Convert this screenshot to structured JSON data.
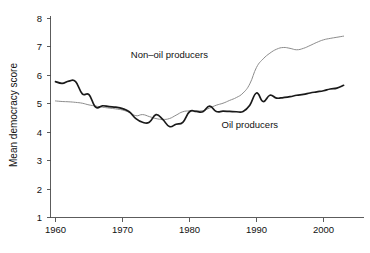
{
  "chart_data": {
    "type": "line",
    "title": "",
    "xlabel": "",
    "ylabel": "Mean democracy score",
    "xlim": [
      1960,
      2003
    ],
    "ylim": [
      1,
      8
    ],
    "grid": false,
    "legend_position": "inline-annotations",
    "xticks": [
      "1960",
      "1970",
      "1980",
      "1990",
      "2000"
    ],
    "xtick_values": [
      1960,
      1970,
      1980,
      1990,
      2000
    ],
    "yticks": [
      "1",
      "2",
      "3",
      "4",
      "5",
      "6",
      "7",
      "8"
    ],
    "ytick_values": [
      1,
      2,
      3,
      4,
      5,
      6,
      7,
      8
    ],
    "x": [
      1960,
      1961,
      1962,
      1963,
      1964,
      1965,
      1966,
      1967,
      1968,
      1969,
      1970,
      1971,
      1972,
      1973,
      1974,
      1975,
      1976,
      1977,
      1978,
      1979,
      1980,
      1981,
      1982,
      1983,
      1984,
      1985,
      1986,
      1987,
      1988,
      1989,
      1990,
      1991,
      1992,
      1993,
      1994,
      1995,
      1996,
      1997,
      1998,
      1999,
      2000,
      2001,
      2002,
      2003
    ],
    "series": [
      {
        "name": "Oil producers",
        "color": "#1a1a1a",
        "label_x": 1989,
        "label_y": 4.15,
        "values": [
          5.78,
          5.72,
          5.8,
          5.78,
          5.35,
          5.32,
          4.88,
          4.93,
          4.9,
          4.88,
          4.83,
          4.72,
          4.48,
          4.35,
          4.35,
          4.62,
          4.45,
          4.2,
          4.28,
          4.35,
          4.72,
          4.73,
          4.72,
          4.92,
          4.73,
          4.74,
          4.73,
          4.72,
          4.73,
          4.95,
          5.38,
          5.08,
          5.3,
          5.2,
          5.22,
          5.25,
          5.3,
          5.33,
          5.38,
          5.42,
          5.46,
          5.52,
          5.55,
          5.65
        ]
      },
      {
        "name": "Non–oil producers",
        "color": "#8c8c8c",
        "label_x": 1977,
        "label_y": 6.6,
        "values": [
          5.1,
          5.08,
          5.07,
          5.05,
          5.02,
          4.96,
          4.92,
          4.88,
          4.85,
          4.82,
          4.78,
          4.7,
          4.58,
          4.62,
          4.55,
          4.48,
          4.45,
          4.48,
          4.6,
          4.72,
          4.75,
          4.75,
          4.76,
          4.85,
          4.95,
          5.02,
          5.12,
          5.22,
          5.38,
          5.7,
          6.28,
          6.58,
          6.78,
          6.92,
          6.98,
          6.95,
          6.9,
          6.95,
          7.05,
          7.16,
          7.25,
          7.3,
          7.34,
          7.38
        ]
      }
    ]
  },
  "figure": {
    "ylabel": "Mean democracy score",
    "annotations": [
      {
        "text": "Non–oil producers"
      },
      {
        "text": "Oil producers"
      }
    ],
    "caption": ""
  }
}
